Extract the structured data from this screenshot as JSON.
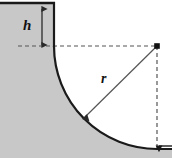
{
  "figure": {
    "kind": "geometry-diagram",
    "width": 172,
    "height": 158,
    "background_color": "#FFFFFF",
    "solid_fill_color": "#C8C8C8",
    "outline_color": "#1A1A1A",
    "dimension_line_color": "#3A3A3A",
    "dashed_line_color": "#555555",
    "labels": {
      "height": "h",
      "radius": "r"
    },
    "geometry": {
      "wall_line_x": 54,
      "datum_line_y": 46,
      "arc_center_x": 157,
      "arc_center_y": 46,
      "arc_radius": 103,
      "height_arrow_x": 42,
      "height_arrow_top_y": 8,
      "height_arrow_bottom_y": 46,
      "radius_arrow_tip_x": 83,
      "radius_arrow_tip_y": 119,
      "bottom_arrow_y": 146,
      "bottom_arrow_from_x": 172,
      "bottom_arrow_to_x": 157
    },
    "dashed_dash_pattern": "4 3"
  }
}
